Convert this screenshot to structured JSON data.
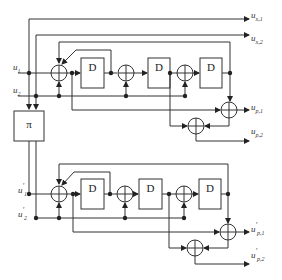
{
  "diagram": {
    "type": "turbo-encoder-block-diagram",
    "inputs": [
      {
        "id": "u1",
        "base": "u",
        "sub": "1",
        "prime": ""
      },
      {
        "id": "u2",
        "base": "u",
        "sub": "2",
        "prime": ""
      },
      {
        "id": "u1p",
        "base": "u",
        "sub": "1",
        "prime": "'"
      },
      {
        "id": "u2p",
        "base": "u",
        "sub": "2",
        "prime": "'"
      }
    ],
    "outputs": [
      {
        "id": "ux1",
        "base": "u",
        "sub": "x,1",
        "prime": ""
      },
      {
        "id": "ux2",
        "base": "u",
        "sub": "x,2",
        "prime": ""
      },
      {
        "id": "up1",
        "base": "u",
        "sub": "p,1",
        "prime": ""
      },
      {
        "id": "up2",
        "base": "u",
        "sub": "p,2",
        "prime": ""
      },
      {
        "id": "up1p",
        "base": "u",
        "sub": "p,1",
        "prime": "'"
      },
      {
        "id": "up2p",
        "base": "u",
        "sub": "p,2",
        "prime": "'"
      }
    ],
    "interleaver": {
      "label": "π"
    },
    "delay_label": "D",
    "encoders": [
      {
        "name": "upper",
        "delays": [
          "D",
          "D",
          "D"
        ]
      },
      {
        "name": "lower",
        "delays": [
          "D",
          "D",
          "D"
        ]
      }
    ]
  }
}
